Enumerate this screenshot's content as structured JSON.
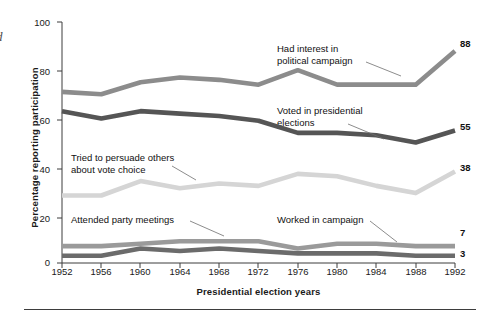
{
  "figure": {
    "margin_mark": "d",
    "bottom_rule": "horizontal-rule"
  },
  "chart_data": {
    "type": "line",
    "title": "",
    "xlabel": "Presidential election years",
    "ylabel": "Percentage reporting participation",
    "xlim": [
      1952,
      1992
    ],
    "ylim": [
      0,
      100
    ],
    "grid": false,
    "legend": "inline-annotations",
    "categories": [
      1952,
      1956,
      1960,
      1964,
      1968,
      1972,
      1976,
      1980,
      1984,
      1988,
      1992
    ],
    "xticklabels": [
      "1952",
      "1956",
      "1960",
      "1964",
      "1968",
      "1972",
      "1976",
      "1980",
      "1984",
      "1988",
      "1992"
    ],
    "yticks": [
      0,
      20,
      40,
      60,
      80,
      100
    ],
    "yticklabels": [
      "0",
      "20",
      "40",
      "60",
      "80",
      "100"
    ],
    "series": [
      {
        "name": "Had interest in political campaign",
        "color": "#8c8c8c",
        "end_label": "88",
        "values": [
          71,
          70,
          75,
          77,
          76,
          74,
          80,
          74,
          74,
          74,
          88
        ]
      },
      {
        "name": "Voted in presidential elections",
        "color": "#555555",
        "end_label": "55",
        "values": [
          63,
          60,
          63,
          62,
          61,
          59,
          54,
          54,
          53,
          50,
          55
        ]
      },
      {
        "name": "Tried to persuade others about vote choice",
        "color": "#d5d5d5",
        "end_label": "38",
        "values": [
          28,
          28,
          34,
          31,
          33,
          32,
          37,
          36,
          32,
          29,
          38
        ]
      },
      {
        "name": "Attended party meetings",
        "color": "#9a9a9a",
        "end_label": "7",
        "values": [
          7,
          7,
          8,
          9,
          9,
          9,
          6,
          8,
          8,
          7,
          7
        ]
      },
      {
        "name": "Worked in campaign",
        "color": "#6b6b6b",
        "end_label": "3",
        "values": [
          3,
          3,
          6,
          5,
          6,
          5,
          4,
          4,
          4,
          3,
          3
        ]
      }
    ],
    "annotations": [
      {
        "id": "had-interest",
        "lines": [
          "Had interest in",
          "political campaign"
        ],
        "text": "Had interest in political campaign"
      },
      {
        "id": "voted",
        "lines": [
          "Voted in presidential",
          "elections"
        ],
        "text": "Voted in presidential elections"
      },
      {
        "id": "persuade",
        "lines": [
          "Tried to persuade others",
          "about vote choice"
        ],
        "text": "Tried to persuade others about vote choice"
      },
      {
        "id": "attended",
        "lines": [
          "Attended party meetings"
        ],
        "text": "Attended party meetings"
      },
      {
        "id": "worked",
        "lines": [
          "Worked in campaign"
        ],
        "text": "Worked in campaign"
      }
    ]
  }
}
